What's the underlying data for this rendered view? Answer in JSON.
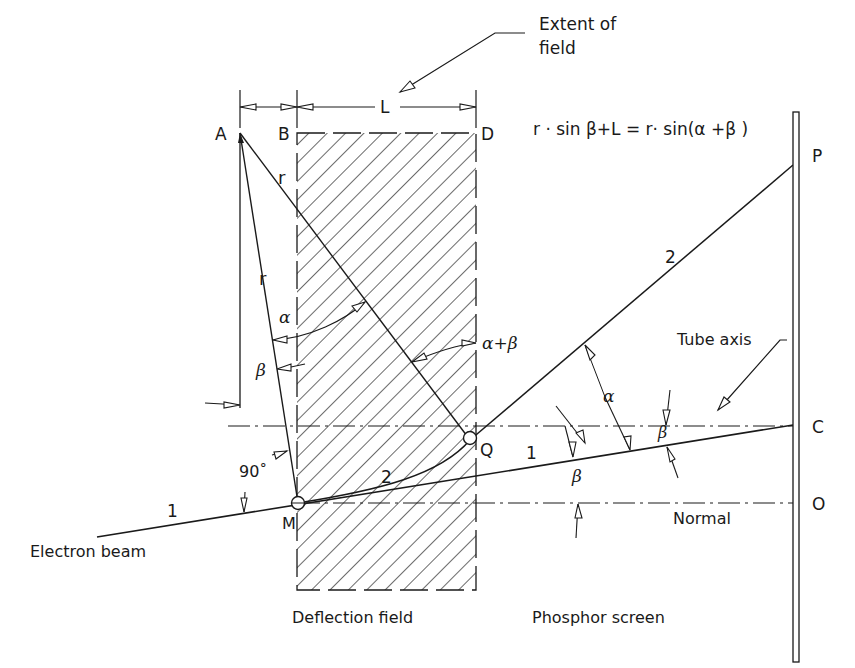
{
  "diagram": {
    "equation": "r · sin β+L  =  r· sin(α +β )",
    "labels": {
      "extent_of_field_line1": "Extent  of",
      "extent_of_field_line2": "field",
      "L": "L",
      "A": "A",
      "B": "B",
      "D": "D",
      "P": "P",
      "C": "C",
      "O": "O",
      "Q": "Q",
      "M": "M",
      "r_upper": "r",
      "r_lower": "r",
      "alpha_left": "α",
      "beta_left": "β",
      "alpha_plus_beta": "α+β",
      "alpha_right": "α",
      "beta_right_upper": "β",
      "beta_right_lower": "β",
      "angle_90": "90˚",
      "ray1_left": "1",
      "ray1_right": "1",
      "ray2_curve": "2",
      "ray2_line": "2",
      "tube_axis": "Tube  axis",
      "normal": "Normal",
      "electron_beam": "Electron  beam",
      "deflection_field": "Deflection  field",
      "phosphor_screen": "Phosphor  screen"
    },
    "colors": {
      "ink": "#1a1a1a",
      "background": "#ffffff"
    }
  }
}
